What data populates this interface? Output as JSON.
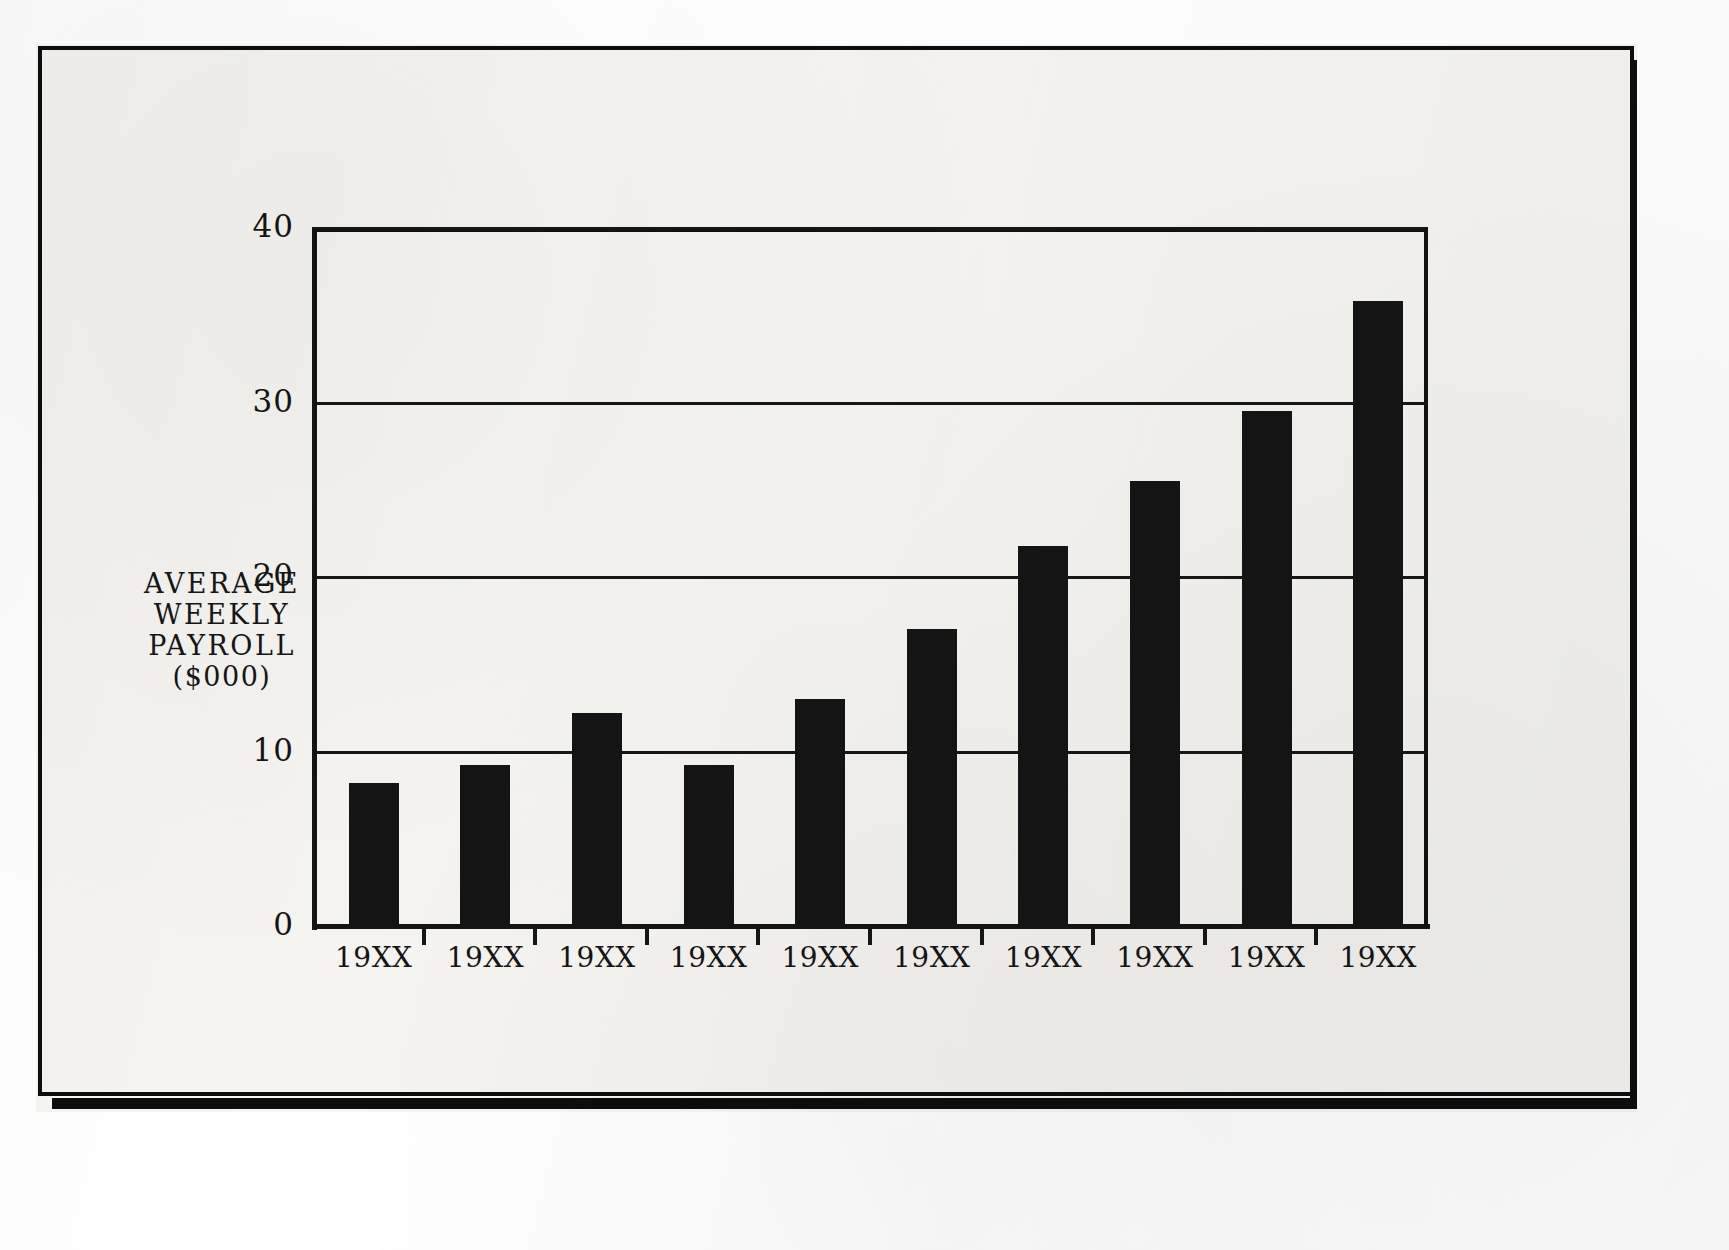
{
  "document": {
    "kind": "scanned-bar-chart-page",
    "paper_color": "#f5f4f0",
    "ink_color": "#141414"
  },
  "chart_data": {
    "type": "bar",
    "title": "",
    "subtitle": "",
    "xlabel": "",
    "ylabel": "AVERAGE WEEKLY PAYROLL ($000)",
    "ylabel_lines": [
      "AVERAGE",
      "WEEKLY",
      "PAYROLL",
      "($000)"
    ],
    "categories": [
      "19XX",
      "19XX",
      "19XX",
      "19XX",
      "19XX",
      "19XX",
      "19XX",
      "19XX",
      "19XX",
      "19XX"
    ],
    "values": [
      8.2,
      9.2,
      12.2,
      9.2,
      13.0,
      17.0,
      21.8,
      25.5,
      29.5,
      35.8
    ],
    "ylim": [
      0,
      40
    ],
    "yticks": [
      0,
      10,
      20,
      30,
      40
    ],
    "ytick_labels": [
      "0",
      "10",
      "20",
      "30",
      "40"
    ],
    "grid": true,
    "grid_axis": "y",
    "legend": false,
    "legend_position": "none",
    "bar_color": "#141414",
    "series": [
      {
        "name": "Average weekly payroll",
        "values": [
          8.2,
          9.2,
          12.2,
          9.2,
          13.0,
          17.0,
          21.8,
          25.5,
          29.5,
          35.8
        ]
      }
    ],
    "annotations": []
  }
}
